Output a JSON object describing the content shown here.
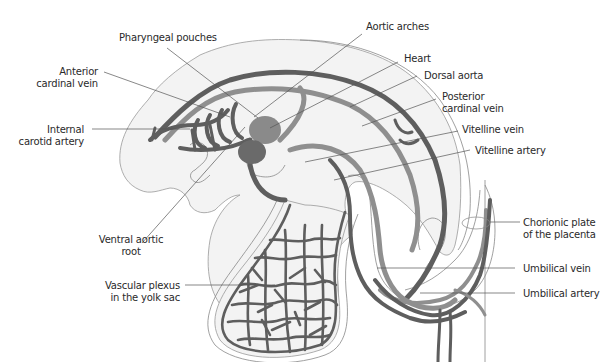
{
  "figure": {
    "colors": {
      "background": "#ffffff",
      "embryo_fill": "#f3f3f3",
      "outline": "#999999",
      "vessel_dark": "#5e5e5e",
      "vessel_light": "#8f8f8f",
      "heart": "#7a7a7a",
      "label_text": "#2a2a2a"
    }
  },
  "labels": {
    "pharyngeal_pouches": "Pharyngeal pouches",
    "anterior_cardinal_vein_1": "Anterior",
    "anterior_cardinal_vein_2": "cardinal vein",
    "internal_carotid_artery_1": "Internal",
    "internal_carotid_artery_2": "carotid artery",
    "ventral_aortic_root_1": "Ventral aortic",
    "ventral_aortic_root_2": "root",
    "vascular_plexus_1": "Vascular plexus",
    "vascular_plexus_2": "in the yolk sac",
    "aortic_arches": "Aortic arches",
    "heart": "Heart",
    "dorsal_aorta": "Dorsal aorta",
    "posterior_cardinal_vein_1": "Posterior",
    "posterior_cardinal_vein_2": "cardinal vein",
    "vitelline_vein": "Vitelline vein",
    "vitelline_artery": "Vitelline artery",
    "chorionic_plate_1": "Chorionic plate",
    "chorionic_plate_2": "of the placenta",
    "umbilical_vein": "Umbilical vein",
    "umbilical_artery": "Umbilical artery"
  }
}
